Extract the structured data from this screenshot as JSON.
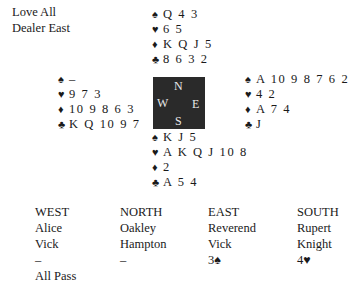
{
  "header": {
    "vulnerability": "Love All",
    "dealer": "Dealer East"
  },
  "suits": {
    "spades": "♠",
    "hearts": "♥",
    "diamonds": "♦",
    "clubs": "♣"
  },
  "hands": {
    "north": {
      "spades": "Q 4 3",
      "hearts": "6 5",
      "diamonds": "K Q J 5",
      "clubs": "8 6 3 2"
    },
    "west": {
      "spades": "–",
      "hearts": "9 7 3",
      "diamonds": "10 9 8 6 3",
      "clubs": "K Q 10 9 7"
    },
    "east": {
      "spades": "A 10 9 8 7 6 2",
      "hearts": "4 2",
      "diamonds": "A 7 4",
      "clubs": "J"
    },
    "south": {
      "spades": "K J 5",
      "hearts": "A K Q J 10 8",
      "diamonds": "2",
      "clubs": "A 5 4"
    }
  },
  "compass": {
    "n": "N",
    "w": "W",
    "e": "E",
    "s": "S"
  },
  "bidding": {
    "columns": [
      {
        "seat": "WEST",
        "first": "Alice",
        "last": "Vick",
        "bids": [
          "–",
          "All Pass"
        ]
      },
      {
        "seat": "NORTH",
        "first": "Oakley",
        "last": "Hampton",
        "bids": [
          "–"
        ]
      },
      {
        "seat": "EAST",
        "first": "Reverend",
        "last": "Vick",
        "bids": [
          "3♠"
        ]
      },
      {
        "seat": "SOUTH",
        "first": "Rupert",
        "last": "Knight",
        "bids": [
          "4♥"
        ]
      }
    ]
  }
}
